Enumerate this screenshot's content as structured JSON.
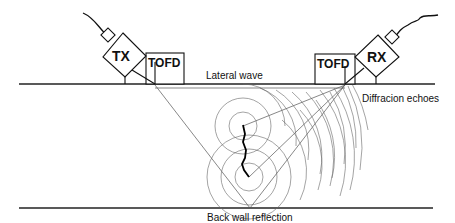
{
  "probes": {
    "transmitter": {
      "label": "TX",
      "wedge_label": "TOFD"
    },
    "receiver": {
      "label": "RX",
      "wedge_label": "TOFD"
    }
  },
  "captions": {
    "lateral_wave": "Lateral wave",
    "diffraction_echoes": "Diffracion echoes",
    "back_wall": "Back wall reflection"
  },
  "colors": {
    "line": "#222222",
    "background": "#ffffff"
  }
}
